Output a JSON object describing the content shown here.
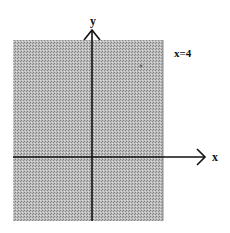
{
  "diagram": {
    "type": "shaded-half-plane",
    "axes": {
      "x_label": "x",
      "y_label": "y"
    },
    "boundary": {
      "equation_label": "x=4",
      "x_value": 4,
      "style": "dashed-or-edge"
    },
    "shaded_region": "x < 4",
    "colors": {
      "shade": "#a8a8a8",
      "shade_dot": "#d8d8d8",
      "axis": "#111111",
      "background": "#ffffff"
    }
  }
}
